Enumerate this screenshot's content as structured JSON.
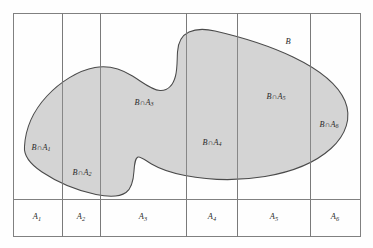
{
  "figure": {
    "colors": {
      "blob_fill": "#d4d4d4",
      "blob_stroke": "#4a4a4a",
      "frame_stroke": "#808080",
      "divider_stroke": "#7a7a7a",
      "label_color": "#2b2b2b",
      "background": "#fefefe"
    },
    "frame": {
      "x": 13,
      "y": 13,
      "width": 347,
      "height": 223
    },
    "dividers": [
      62,
      100,
      186,
      237,
      310
    ],
    "baseline_y": 199
  },
  "event_label": {
    "name": "B",
    "text": "B",
    "x": 288,
    "y": 42
  },
  "intersection_labels": [
    {
      "name": "b-cap-a1",
      "prefix": "B",
      "op": "∩",
      "set": "A",
      "sub": "1",
      "x": 41,
      "y": 148
    },
    {
      "name": "b-cap-a2",
      "prefix": "B",
      "op": "∩",
      "set": "A",
      "sub": "2",
      "x": 82,
      "y": 173
    },
    {
      "name": "b-cap-a3",
      "prefix": "B",
      "op": "∩",
      "set": "A",
      "sub": "3",
      "x": 144,
      "y": 103
    },
    {
      "name": "b-cap-a4",
      "prefix": "B",
      "op": "∩",
      "set": "A",
      "sub": "4",
      "x": 212,
      "y": 143
    },
    {
      "name": "b-cap-a5",
      "prefix": "B",
      "op": "∩",
      "set": "A",
      "sub": "5",
      "x": 276,
      "y": 97
    },
    {
      "name": "b-cap-a6",
      "prefix": "B",
      "op": "∩",
      "set": "A",
      "sub": "6",
      "x": 329,
      "y": 125
    }
  ],
  "partition_labels": [
    {
      "name": "column-label-a1",
      "set": "A",
      "sub": "1",
      "x": 37,
      "y": 218
    },
    {
      "name": "column-label-a2",
      "set": "A",
      "sub": "2",
      "x": 81,
      "y": 218
    },
    {
      "name": "column-label-a3",
      "set": "A",
      "sub": "3",
      "x": 143,
      "y": 218
    },
    {
      "name": "column-label-a4",
      "set": "A",
      "sub": "4",
      "x": 212,
      "y": 218
    },
    {
      "name": "column-label-a5",
      "set": "A",
      "sub": "5",
      "x": 274,
      "y": 218
    },
    {
      "name": "column-label-a6",
      "set": "A",
      "sub": "6",
      "x": 335,
      "y": 218
    }
  ],
  "blob_path": "M 24.5 146.5 C 25.5 128.0 34.0 110.0 47.0 96.0 C 60.0 82.0 78.0 70.5 95.0 67.5 C 110.0 64.8 122.0 69.5 132.5 76.0 C 143.0 82.5 151.5 90.0 160.0 90.5 C 168.5 91.0 173.5 84.0 175.5 76.0 C 177.5 68.0 177.0 59.5 177.5 52.0 C 178.0 43.0 181.5 35.5 189.0 32.0 C 196.5 28.5 206.5 29.0 215.0 31.0 C 238.0 36.3 268.0 45.0 293.0 57.0 C 318.0 69.0 338.0 84.5 345.0 101.0 C 352.0 117.5 346.0 135.0 331.0 148.5 C 316.0 162.0 292.0 172.0 265.0 176.5 C 238.0 181.0 208.0 180.0 185.0 175.5 C 172.0 173.0 160.0 169.0 151.5 164.0 C 145.0 160.2 140.5 156.0 138.0 157.0 C 135.0 158.2 134.5 164.0 134.0 171.0 C 133.5 179.0 132.5 188.0 126.0 192.5 C 119.5 197.0 108.0 197.0 96.0 194.5 C 78.0 190.8 57.0 182.0 42.0 172.0 C 30.5 164.3 23.5 156.5 24.5 146.5 Z"
}
